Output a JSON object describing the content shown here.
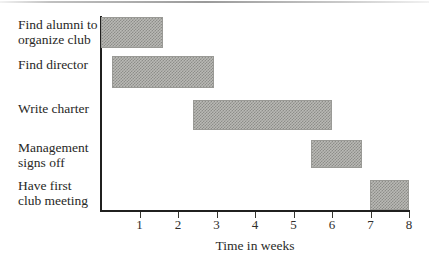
{
  "chart_data": {
    "type": "bar",
    "subtype": "gantt",
    "title": "",
    "xlabel": "Time in weeks",
    "ylabel": "",
    "xlim": [
      0,
      8
    ],
    "xticks": [
      1,
      2,
      3,
      4,
      5,
      6,
      7,
      8
    ],
    "xtick_labels": [
      "1",
      "2",
      "3",
      "4",
      "5",
      "6",
      "7",
      "8"
    ],
    "grid": false,
    "legend": false,
    "bar_fill": "checkerboard-dither-gray",
    "bar_fill_color": "#b9b9b5",
    "bar_edge_color": "#9a9a96",
    "axis_color": "#20201f",
    "background_color": "#ffffff",
    "categories": [
      "Find alumni to organize club",
      "Find director",
      "Write charter",
      "Management signs off",
      "Have first club meeting"
    ],
    "tasks": [
      {
        "label_line1": "Find alumni to",
        "label_line2": "organize club",
        "start": 0.0,
        "end": 1.6,
        "duration": 1.6
      },
      {
        "label_line1": "Find director",
        "label_line2": "",
        "start": 0.3,
        "end": 2.9,
        "duration": 2.6
      },
      {
        "label_line1": "Write charter",
        "label_line2": "",
        "start": 2.4,
        "end": 6.0,
        "duration": 3.6
      },
      {
        "label_line1": "Management",
        "label_line2": "signs off",
        "start": 5.5,
        "end": 6.8,
        "duration": 1.3
      },
      {
        "label_line1": "Have first",
        "label_line2": "club meeting",
        "start": 7.0,
        "end": 8.0,
        "duration": 1.0
      }
    ]
  }
}
